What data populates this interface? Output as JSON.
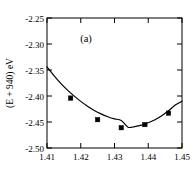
{
  "chart_data": {
    "type": "line",
    "title": "",
    "panel_label": "(a)",
    "xlabel": "",
    "ylabel": "(E + 940) eV",
    "xlim": [
      1.41,
      1.45
    ],
    "ylim": [
      -2.5,
      -2.25
    ],
    "grid": false,
    "legend": "none",
    "xticks": [
      1.41,
      1.42,
      1.43,
      1.44,
      1.45
    ],
    "xticklabels": [
      "1.41",
      "1.42",
      "1.43",
      "1.44",
      "1.45"
    ],
    "yticks": [
      -2.25,
      -2.3,
      -2.35,
      -2.4,
      -2.45,
      -2.5
    ],
    "yticklabels": [
      "-2.25",
      "-2.30",
      "-2.35",
      "-2.40",
      "-2.45",
      "-2.50"
    ],
    "series": [
      {
        "name": "fitted curve",
        "style": "solid-line",
        "x": [
          1.41,
          1.412,
          1.414,
          1.416,
          1.418,
          1.42,
          1.422,
          1.424,
          1.426,
          1.428,
          1.43,
          1.432,
          1.434,
          1.436,
          1.438,
          1.44,
          1.442,
          1.444,
          1.446,
          1.448,
          1.45
        ],
        "y": [
          -2.344,
          -2.3605,
          -2.3752,
          -2.3882,
          -2.3998,
          -2.4103,
          -2.4196,
          -2.4277,
          -2.4344,
          -2.4398,
          -2.444,
          -2.447,
          -2.46,
          -2.4588,
          -2.456,
          -2.4515,
          -2.4455,
          -2.4378,
          -2.4285,
          -2.4175,
          -2.41
        ]
      },
      {
        "name": "computed points",
        "style": "filled-square-markers",
        "x": [
          1.417,
          1.425,
          1.432,
          1.439,
          1.446
        ],
        "y": [
          -2.404,
          -2.4455,
          -2.461,
          -2.455,
          -2.433
        ]
      }
    ],
    "minimum": {
      "x": 1.4325,
      "y": -2.4612
    }
  },
  "colors": {
    "background": "#ffffff",
    "axis": "#000000",
    "curve": "#000000",
    "marker": "#000000"
  }
}
